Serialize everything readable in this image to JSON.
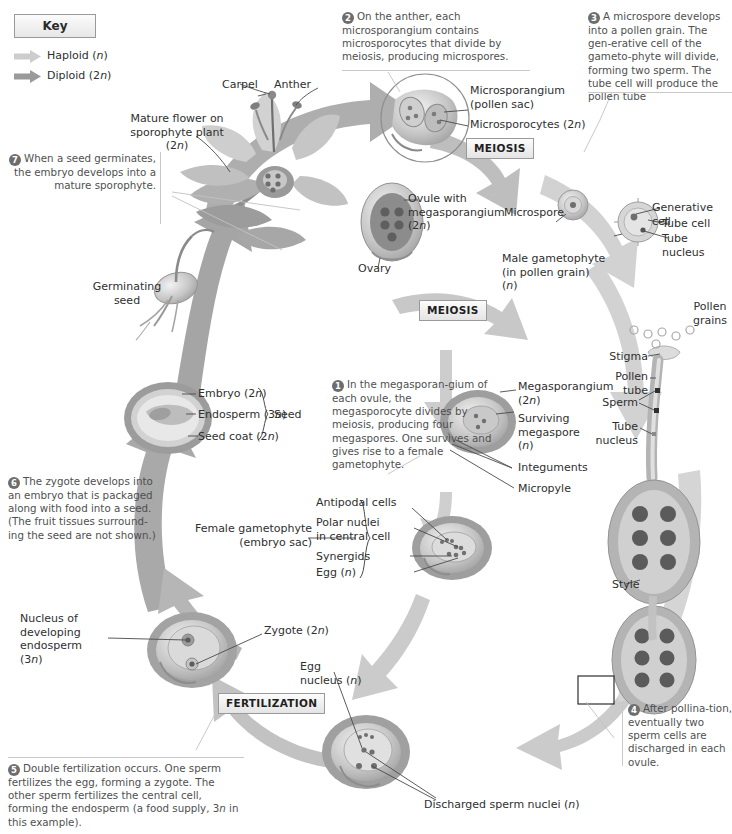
{
  "key": {
    "heading": "Key",
    "items": [
      {
        "label": "Haploid (n)",
        "color": "#c9c9c9",
        "name": "haploid"
      },
      {
        "label": "Diploid (2n)",
        "color": "#9a9a9a",
        "name": "diploid"
      }
    ]
  },
  "process_boxes": [
    {
      "label": "MEIOSIS",
      "name": "meiosis-top"
    },
    {
      "label": "MEIOSIS",
      "name": "meiosis-middle"
    },
    {
      "label": "FERTILIZATION",
      "name": "fertilization"
    }
  ],
  "steps": [
    {
      "num": "1",
      "text": "In the megasporan-gium of each ovule, the megasporocyte divides by meiosis, producing four megaspores. One survives and gives rise to a female gametophyte."
    },
    {
      "num": "2",
      "text": "On the anther, each microsporangium contains microsporocytes that divide by meiosis, producing microspores."
    },
    {
      "num": "3",
      "text": "A microspore develops into a pollen grain. The gen-erative cell of the gameto-phyte will divide, forming two sperm. The tube cell will produce the pollen tube"
    },
    {
      "num": "4",
      "text": "After pollina-tion, eventually two sperm cells are discharged in each ovule."
    },
    {
      "num": "5",
      "text": "Double fertilization occurs. One sperm fertilizes the egg, forming a zygote. The other sperm fertilizes the central cell, forming the endosperm (a food supply, 3n in this example)."
    },
    {
      "num": "6",
      "text": "The zygote develops into an embryo that is packaged along with food into a seed. (The fruit tissues surround-ing the seed are not shown.)"
    },
    {
      "num": "7",
      "text": "When a seed germinates, the embryo develops into a mature sporophyte."
    }
  ],
  "labels": {
    "carpel": "Carpel",
    "anther": "Anther",
    "mature_flower": "Mature flower on\nsporophyte plant\n(2n)",
    "microsporangium": "Microsporangium\n(pollen sac)",
    "microsporocytes": "Microsporocytes (2n)",
    "ovule_with_megasporangium": "Ovule with\nmegasporangium\n(2n)",
    "ovary": "Ovary",
    "microspore": "Microspore",
    "generative_cell": "Generative cell",
    "tube_cell": "Tube cell",
    "tube_nucleus_top": "Tube nucleus",
    "male_gametophyte": "Male gametophyte\n(in pollen grain)\n(n)",
    "pollen_grains": "Pollen\ngrains",
    "stigma": "Stigma",
    "pollen_tube": "Pollen\ntube",
    "sperm": "Sperm",
    "tube_nucleus_lower": "Tube\nnucleus",
    "germinating_seed": "Germinating\nseed",
    "embryo": "Embryo (2n)",
    "endosperm": "Endosperm (3n)",
    "seed_coat": "Seed coat (2n)",
    "seed": "Seed",
    "megasporangium": "Megasporangium\n(2n)",
    "surviving_megaspore": "Surviving\nmegaspore\n(n)",
    "integuments": "Integuments",
    "micropyle": "Micropyle",
    "antipodal_cells": "Antipodal cells",
    "polar_nuclei": "Polar nuclei\nin central cell",
    "synergids": "Synergids",
    "egg_n": "Egg (n)",
    "female_gametophyte": "Female gametophyte\n(embryo sac)",
    "style": "Style",
    "nucleus_of_developing_endosperm": "Nucleus of\ndeveloping\nendosperm\n(3n)",
    "zygote": "Zygote (2n)",
    "egg_nucleus": "Egg\nnucleus (n)",
    "discharged_sperm_nuclei": "Discharged sperm nuclei (n)"
  },
  "colors": {
    "haploid_arrow": "#cdcdcd",
    "diploid_arrow": "#9b9b9b",
    "leader_line": "#4a4a4a",
    "text": "#3a3a3a",
    "structure_mid": "#b4b4b4",
    "structure_dark": "#7d7d7d",
    "structure_light": "#dcdcdc"
  }
}
